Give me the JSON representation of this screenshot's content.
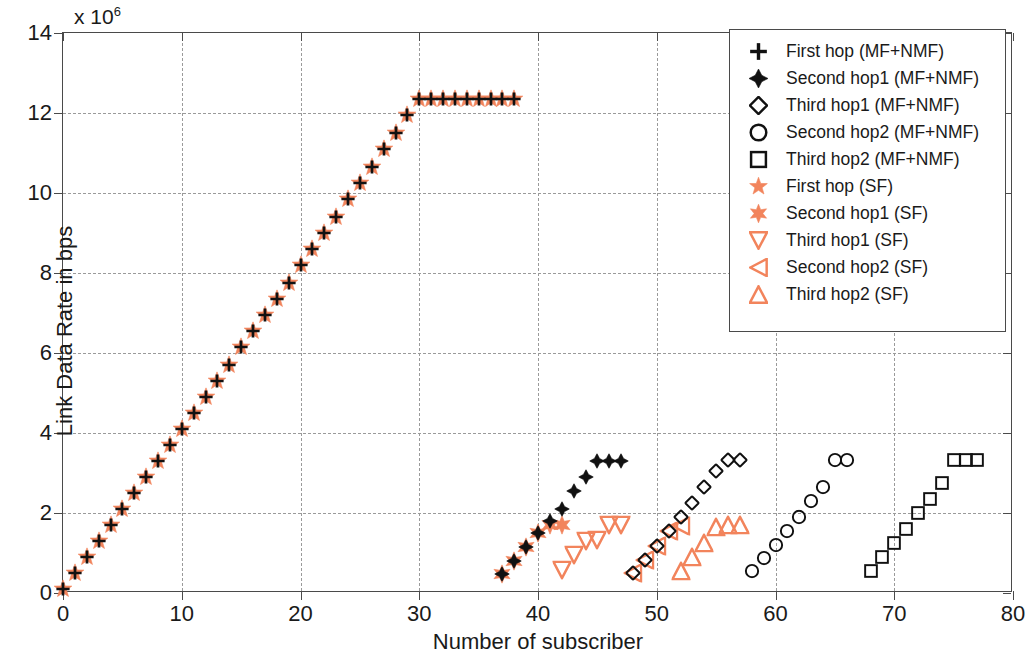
{
  "chart_data": {
    "type": "scatter",
    "title": "",
    "xlabel": "Number of subscriber",
    "ylabel": "Link Data Rate in bps",
    "y_exponent_label": "x 10",
    "y_exponent_sup": "6",
    "xlim": [
      0,
      80
    ],
    "ylim": [
      0,
      14
    ],
    "xticks": [
      0,
      10,
      20,
      30,
      40,
      50,
      60,
      70,
      80
    ],
    "yticks": [
      0,
      2,
      4,
      6,
      8,
      10,
      12,
      14
    ],
    "grid": true,
    "legend_position": "top-right",
    "colors": {
      "mfnmf": "#111111",
      "sf": "#F2845C",
      "axis": "#4a4a4a",
      "grid": "#9a9a9a",
      "background": "#ffffff"
    },
    "series": [
      {
        "name": "First hop (MF+NMF)",
        "marker": "plus",
        "color": "#111111",
        "x": [
          0,
          1,
          2,
          3,
          4,
          5,
          6,
          7,
          8,
          9,
          10,
          11,
          12,
          13,
          14,
          15,
          16,
          17,
          18,
          19,
          20,
          21,
          22,
          23,
          24,
          25,
          26,
          27,
          28,
          29,
          30,
          31,
          32,
          33,
          34,
          35,
          36,
          37,
          38
        ],
        "y": [
          0.05,
          0.45,
          0.85,
          1.25,
          1.65,
          2.05,
          2.45,
          2.85,
          3.25,
          3.65,
          4.05,
          4.45,
          4.85,
          5.25,
          5.65,
          6.1,
          6.5,
          6.9,
          7.3,
          7.7,
          8.15,
          8.55,
          8.95,
          9.35,
          9.8,
          10.2,
          10.6,
          11.05,
          11.45,
          11.9,
          12.3,
          12.3,
          12.3,
          12.3,
          12.3,
          12.3,
          12.3,
          12.3,
          12.3
        ]
      },
      {
        "name": "Second hop1 (MF+NMF)",
        "marker": "fourstar",
        "color": "#111111",
        "x": [
          37,
          38,
          39,
          40,
          41,
          42,
          43,
          44,
          45,
          46,
          47
        ],
        "y": [
          0.42,
          0.75,
          1.1,
          1.45,
          1.75,
          2.05,
          2.5,
          2.85,
          3.25,
          3.25,
          3.25
        ]
      },
      {
        "name": "Third hop1 (MF+NMF)",
        "marker": "diamond",
        "color": "#111111",
        "x": [
          48,
          49,
          50,
          51,
          52,
          53,
          54,
          55,
          56,
          57
        ],
        "y": [
          0.45,
          0.78,
          1.12,
          1.5,
          1.85,
          2.2,
          2.6,
          3.0,
          3.28,
          3.28
        ]
      },
      {
        "name": "Second hop2 (MF+NMF)",
        "marker": "circle",
        "color": "#111111",
        "x": [
          58,
          59,
          60,
          61,
          62,
          63,
          64,
          65,
          66
        ],
        "y": [
          0.5,
          0.82,
          1.15,
          1.5,
          1.85,
          2.25,
          2.6,
          3.28,
          3.28
        ]
      },
      {
        "name": "Third hop2 (MF+NMF)",
        "marker": "square",
        "color": "#111111",
        "x": [
          68,
          69,
          70,
          71,
          72,
          73,
          74,
          75,
          76,
          77
        ],
        "y": [
          0.5,
          0.85,
          1.2,
          1.55,
          1.95,
          2.3,
          2.7,
          3.28,
          3.28,
          3.28
        ]
      },
      {
        "name": "First hop (SF)",
        "marker": "star5",
        "color": "#F2845C",
        "x": [
          0,
          1,
          2,
          3,
          4,
          5,
          6,
          7,
          8,
          9,
          10,
          11,
          12,
          13,
          14,
          15,
          16,
          17,
          18,
          19,
          20,
          21,
          22,
          23,
          24,
          25,
          26,
          27,
          28,
          29,
          30,
          31,
          32,
          33,
          34,
          35,
          36,
          37,
          38
        ],
        "y": [
          0.05,
          0.45,
          0.85,
          1.25,
          1.65,
          2.05,
          2.45,
          2.85,
          3.25,
          3.65,
          4.05,
          4.45,
          4.85,
          5.25,
          5.65,
          6.1,
          6.5,
          6.9,
          7.3,
          7.7,
          8.15,
          8.55,
          8.95,
          9.35,
          9.8,
          10.2,
          10.6,
          11.05,
          11.45,
          11.9,
          12.3,
          12.3,
          12.3,
          12.3,
          12.3,
          12.3,
          12.3,
          12.3,
          12.3
        ]
      },
      {
        "name": "Second hop1 (SF)",
        "marker": "star6",
        "color": "#F2845C",
        "x": [
          37,
          38,
          39,
          40,
          41,
          42
        ],
        "y": [
          0.42,
          0.75,
          1.1,
          1.45,
          1.65,
          1.65
        ]
      },
      {
        "name": "Third hop1 (SF)",
        "marker": "tri-down",
        "color": "#F2845C",
        "x": [
          42,
          43,
          44,
          45,
          46,
          47
        ],
        "y": [
          0.52,
          0.9,
          1.25,
          1.28,
          1.65,
          1.65
        ]
      },
      {
        "name": "Second hop2 (SF)",
        "marker": "tri-left",
        "color": "#F2845C",
        "x": [
          48,
          49,
          50,
          51,
          52
        ],
        "y": [
          0.45,
          0.78,
          1.12,
          1.5,
          1.62
        ]
      },
      {
        "name": "Third hop2 (SF)",
        "marker": "tri-up",
        "color": "#F2845C",
        "x": [
          52,
          53,
          54,
          55,
          56,
          57
        ],
        "y": [
          0.5,
          0.85,
          1.2,
          1.6,
          1.65,
          1.65
        ]
      }
    ]
  },
  "legend": {
    "items": [
      {
        "label": "First hop (MF+NMF)",
        "marker": "plus",
        "color": "#111111"
      },
      {
        "label": "Second hop1 (MF+NMF)",
        "marker": "fourstar",
        "color": "#111111"
      },
      {
        "label": "Third hop1 (MF+NMF)",
        "marker": "diamond",
        "color": "#111111"
      },
      {
        "label": "Second hop2 (MF+NMF)",
        "marker": "circle",
        "color": "#111111"
      },
      {
        "label": "Third hop2 (MF+NMF)",
        "marker": "square",
        "color": "#111111"
      },
      {
        "label": "First hop (SF)",
        "marker": "star5",
        "color": "#F2845C"
      },
      {
        "label": "Second hop1 (SF)",
        "marker": "star6",
        "color": "#F2845C"
      },
      {
        "label": "Third hop1 (SF)",
        "marker": "tri-down",
        "color": "#F2845C"
      },
      {
        "label": "Second hop2 (SF)",
        "marker": "tri-left",
        "color": "#F2845C"
      },
      {
        "label": "Third hop2 (SF)",
        "marker": "tri-up",
        "color": "#F2845C"
      }
    ]
  }
}
